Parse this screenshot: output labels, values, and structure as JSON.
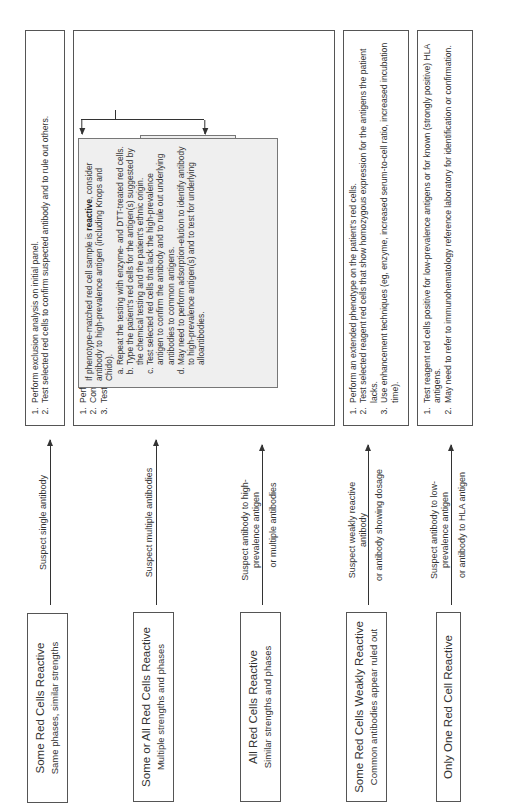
{
  "rows": [
    {
      "condition": {
        "title": "Some Red Cells Reactive",
        "subtitle": "Same phases, similar strengths"
      },
      "arrow_label": {
        "above": "Suspect single antibody",
        "below": ""
      },
      "actions": [
        "Perform exclusion analysis on initial panel.",
        "Test selected red cells to confirm suspected antibody and to rule out others."
      ]
    },
    {
      "condition": {
        "title": "Some or All Red Cells Reactive",
        "subtitle": "Multiple strengths and phases"
      },
      "arrow_label": {
        "above": "Suspect multiple antibodies",
        "below": ""
      },
      "actions": [
        "Perform an extended phenotype on the patient's red cells.",
        "Consider dosage to explain multiple strengths.",
        "Test a reagent red cell sample that matches the patient's phenotype."
      ],
      "branches": {
        "nonreactive": {
          "pre": "If phenotype-matched red cell sample is ",
          "bold": "nonreactive",
          "post": ", test selected red cells to confirm or rule-out common antibodies."
        },
        "reactive": {
          "pre": "If phenotype-matched red cell sample is ",
          "bold": "reactive",
          "post": ", consider antibody to high-prevalence antigen (including Knops and Chido).",
          "steps": [
            "Repeat the testing with enzyme- and DTT-treated red cells.",
            "Type the patient's red cells for the antigen(s) suggested by the chemical testing and the patient's ethnic origin.",
            "Test selected red cells that lack the high-prevalence antigen to confirm the antibody and to rule out underlying antibodies to common antigens.",
            "May need to perform adsorption-elution to identify antibody to high-prevalence antigen(s) and to test for underlying alloantibodies."
          ]
        }
      }
    },
    {
      "condition": {
        "title": "All Red Cells Reactive",
        "subtitle": "Similar strengths and phases"
      },
      "arrow_label": {
        "above": "Suspect antibody to high-prevalence antigen",
        "below": "or multiple antibodies"
      }
    },
    {
      "condition": {
        "title": "Some Red Cells Weakly Reactive",
        "subtitle": "Common antibodies appear ruled out"
      },
      "arrow_label": {
        "above": "Suspect weakly reactive antibody",
        "below": "or antibody showing dosage"
      },
      "actions": [
        "Perform an extended phenotype on the patient's red cells.",
        "Test selected reagent red cells that show homozygous expression for the antigens the patient lacks.",
        "Use enhancement techniques (eg, enzyme, increased serum-to-cell ratio, increased incubation time)."
      ]
    },
    {
      "condition": {
        "title": "Only One Red Cell Reactive",
        "subtitle": ""
      },
      "arrow_label": {
        "above": "Suspect antibody to low-prevalence antigen",
        "below": "or antibody to HLA antigen"
      },
      "actions": [
        "Test reagent red cells positive for low-prevalence antigens or for known (strongly positive) HLA antigens.",
        "May need to refer to immunohematology reference laboratory for identification or confirmation."
      ]
    }
  ]
}
